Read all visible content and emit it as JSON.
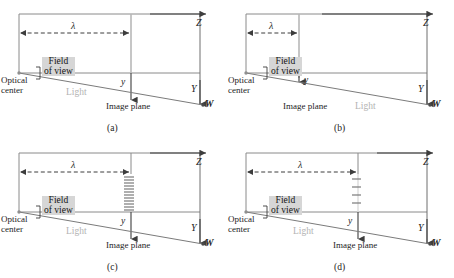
{
  "figure": {
    "caption_labels": [
      "(a)",
      "(b)",
      "(c)",
      "(d)"
    ],
    "colors": {
      "frame_line": "#8a8a8a",
      "axis_line": "#4a4a4a",
      "ray_line": "#7b7b7b",
      "image_plane_line": "#b8b8b8",
      "tick_line": "#7a7a7a",
      "fov_label_bg": "#d6d6d6",
      "light_text": "#b3b3b3",
      "background": "#ffffff"
    }
  },
  "panels": [
    {
      "id": "(a)",
      "labels": {
        "z_axis": "Z",
        "y_axis": "Y",
        "w_axis": "W",
        "lambda": "λ",
        "y_offset": "y",
        "optical_center_line1": "Optical",
        "optical_center_line2": "center",
        "field_of_view_line1": "Field",
        "field_of_view_line2": "of view",
        "light": "Light",
        "image_plane": "Image plane"
      },
      "geometry": {
        "lambda_length_px": 112,
        "image_plane_style": "solid",
        "image_plane_x": 131,
        "y_arrow_length_px": 33,
        "tick_count": 0
      }
    },
    {
      "id": "(b)",
      "labels": {
        "z_axis": "Z",
        "y_axis": "Y",
        "w_axis": "W",
        "lambda": "λ",
        "y_offset": "y",
        "optical_center_line1": "Optical",
        "optical_center_line2": "center",
        "field_of_view_line1": "Field",
        "field_of_view_line2": "of view",
        "light": "Light",
        "image_plane": "Image plane"
      },
      "geometry": {
        "lambda_length_px": 53,
        "image_plane_style": "solid",
        "image_plane_x": 72,
        "y_arrow_length_px": 12,
        "tick_count": 0
      }
    },
    {
      "id": "(c)",
      "labels": {
        "z_axis": "Z",
        "y_axis": "Y",
        "w_axis": "W",
        "lambda": "λ",
        "y_offset": "y",
        "optical_center_line1": "Optical",
        "optical_center_line2": "center",
        "field_of_view_line1": "Field",
        "field_of_view_line2": "of view",
        "light": "Light",
        "image_plane": "Image plane"
      },
      "geometry": {
        "lambda_length_px": 112,
        "image_plane_style": "dense-ticks",
        "image_plane_x": 131,
        "y_arrow_length_px": 33,
        "tick_count": 13
      }
    },
    {
      "id": "(d)",
      "labels": {
        "z_axis": "Z",
        "y_axis": "Y",
        "w_axis": "W",
        "lambda": "λ",
        "y_offset": "y",
        "optical_center_line1": "Optical",
        "optical_center_line2": "center",
        "field_of_view_line1": "Field",
        "field_of_view_line2": "of view",
        "light": "Light",
        "image_plane": "Image plane"
      },
      "geometry": {
        "lambda_length_px": 112,
        "image_plane_style": "sparse-ticks",
        "image_plane_x": 131,
        "y_arrow_length_px": 33,
        "tick_count": 5
      }
    }
  ]
}
